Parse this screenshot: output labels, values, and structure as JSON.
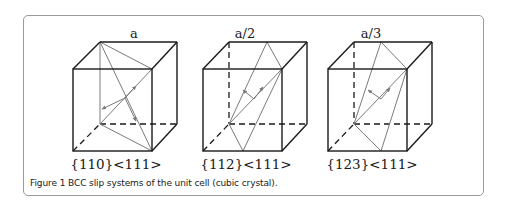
{
  "figure": {
    "caption": "Figure 1 BCC slip systems of the unit cell (cubic crystal).",
    "colors": {
      "edge": "#1a1a1a",
      "plane": "#7a7a7a",
      "border": "#9a9a9a"
    },
    "cubes": [
      {
        "title": "a",
        "label": "{110}<111>"
      },
      {
        "title": "a/2",
        "label": "{112}<111>"
      },
      {
        "title": "a/3",
        "label": "{123}<111>"
      }
    ]
  }
}
